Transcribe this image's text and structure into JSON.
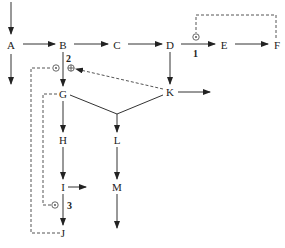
{
  "diagram": {
    "nodes": [
      {
        "id": "A",
        "label": "A",
        "x": 11,
        "y": 45
      },
      {
        "id": "B",
        "label": "B",
        "x": 63,
        "y": 45
      },
      {
        "id": "C",
        "label": "C",
        "x": 117,
        "y": 45
      },
      {
        "id": "D",
        "label": "D",
        "x": 170,
        "y": 45
      },
      {
        "id": "E",
        "label": "E",
        "x": 224,
        "y": 45
      },
      {
        "id": "F",
        "label": "F",
        "x": 277,
        "y": 45
      },
      {
        "id": "G",
        "label": "G",
        "x": 63,
        "y": 94
      },
      {
        "id": "K",
        "label": "K",
        "x": 170,
        "y": 93
      },
      {
        "id": "H",
        "label": "H",
        "x": 63,
        "y": 140
      },
      {
        "id": "L",
        "label": "L",
        "x": 117,
        "y": 140
      },
      {
        "id": "I",
        "label": "I",
        "x": 63,
        "y": 187
      },
      {
        "id": "M",
        "label": "M",
        "x": 117,
        "y": 187
      },
      {
        "id": "J",
        "label": "J",
        "x": 63,
        "y": 233
      }
    ],
    "annotations": [
      {
        "id": "1",
        "label": "1"
      },
      {
        "id": "2",
        "label": "2"
      },
      {
        "id": "3",
        "label": "3"
      }
    ],
    "symbols": {
      "odot": "⊙",
      "oplus": "⊕"
    },
    "edges": [
      {
        "from": "entry",
        "to": "A",
        "style": "solid"
      },
      {
        "from": "A",
        "to": "B",
        "style": "solid"
      },
      {
        "from": "A",
        "to": "exit",
        "style": "solid"
      },
      {
        "from": "B",
        "to": "C",
        "style": "solid"
      },
      {
        "from": "C",
        "to": "D",
        "style": "solid"
      },
      {
        "from": "D",
        "to": "E",
        "style": "solid",
        "label": "1"
      },
      {
        "from": "E",
        "to": "F",
        "style": "solid"
      },
      {
        "from": "D",
        "to": "K",
        "style": "solid"
      },
      {
        "from": "B",
        "to": "G",
        "style": "solid",
        "label": "2"
      },
      {
        "from": "K",
        "to": "exit",
        "style": "solid"
      },
      {
        "from": "K",
        "to": "B-oplus",
        "style": "dashed"
      },
      {
        "from": "G",
        "to": "join",
        "style": "solid"
      },
      {
        "from": "K",
        "to": "join",
        "style": "solid"
      },
      {
        "from": "join",
        "to": "L",
        "style": "solid"
      },
      {
        "from": "G",
        "to": "H",
        "style": "solid"
      },
      {
        "from": "H",
        "to": "I",
        "style": "solid"
      },
      {
        "from": "I",
        "to": "exit",
        "style": "solid"
      },
      {
        "from": "I",
        "to": "J",
        "style": "solid",
        "label": "3"
      },
      {
        "from": "L",
        "to": "M",
        "style": "solid"
      },
      {
        "from": "M",
        "to": "exit",
        "style": "solid"
      },
      {
        "from": "F",
        "to": "D-E odot",
        "style": "dashed"
      },
      {
        "from": "J",
        "to": "B-G odot",
        "style": "dashed"
      },
      {
        "from": "G",
        "to": "I-J odot",
        "style": "dashed"
      }
    ]
  }
}
